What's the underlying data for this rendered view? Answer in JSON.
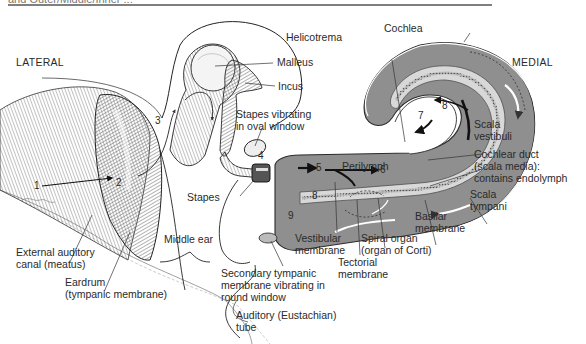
{
  "figure": {
    "top_fragment": "and Outer/Middle/Inner ...",
    "orientation": {
      "left": "LATERAL",
      "right": "MEDIAL"
    },
    "colors": {
      "fluid": "#8f8f8f",
      "duct": "#d8d8d8",
      "outline": "#2b2b2b",
      "paper": "#ffffff"
    },
    "labels": {
      "malleus": "Malleus",
      "incus": "Incus",
      "helicotrema": "Helicotrema",
      "cochlea": "Cochlea",
      "stapes_vibrating": "Stapes vibrating\nin oval window",
      "scala_vestibuli": "Scala\nvestibuli",
      "perilymph": "Perilymph",
      "cochlear_duct": "Cochlear duct\n(scala media):\ncontains endolymph",
      "scala_tympani": "Scala\ntympani",
      "basilar_membrane": "Basilar\nmembrane",
      "stapes": "Stapes",
      "middle_ear": "Middle ear",
      "external_canal": "External auditory\ncanal (meatus)",
      "eardrum": "Eardrum\n(tympanic membrane)",
      "vestibular_membrane": "Vestibular\nmembrane",
      "tectorial_membrane": "Tectorial\nmembrane",
      "spiral_organ": "Spiral organ\n(organ of Corti)",
      "secondary_tympanic": "Secondary tympanic\nmembrane vibrating in\nround window",
      "auditory_tube": "Auditory (Eustachian)\ntube",
      "signature": "Kalasce"
    },
    "steps": [
      "1",
      "2",
      "3",
      "4",
      "5",
      "6",
      "7",
      "8",
      "8",
      "9"
    ]
  }
}
